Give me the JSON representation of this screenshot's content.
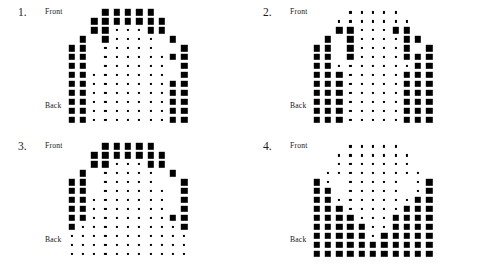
{
  "page": {
    "background": "#ffffff",
    "dot_color": "#000000",
    "width": 490,
    "height": 268
  },
  "labels": {
    "front": "Front",
    "back": "Back"
  },
  "panels": [
    {
      "id": "panel-1",
      "number": "1.",
      "front_label": "Front",
      "back_label": "Back",
      "chart_data": {
        "type": "heatmap",
        "title": "1.",
        "xlabel": "",
        "ylabel": "",
        "encoding": "dot area proportional to value; 0 = absent",
        "rows": 13,
        "cols": 11,
        "row_labels": [
          "Front",
          "",
          "",
          "",
          "",
          "",
          "",
          "",
          "",
          "",
          "",
          "",
          "Back"
        ],
        "vmin": 0,
        "vmax": 9,
        "values": [
          [
            0,
            0,
            0,
            9,
            9,
            9,
            9,
            9,
            0,
            0,
            0
          ],
          [
            0,
            0,
            9,
            9,
            9,
            9,
            9,
            9,
            9,
            0,
            0
          ],
          [
            0,
            0,
            9,
            9,
            1,
            1,
            1,
            9,
            9,
            0,
            0
          ],
          [
            0,
            9,
            0,
            9,
            1,
            1,
            1,
            1,
            0,
            9,
            0
          ],
          [
            9,
            9,
            0,
            1,
            1,
            1,
            1,
            1,
            0,
            0,
            9
          ],
          [
            9,
            9,
            0,
            1,
            1,
            1,
            1,
            1,
            1,
            9,
            9
          ],
          [
            9,
            9,
            0,
            1,
            1,
            1,
            1,
            1,
            1,
            0,
            9
          ],
          [
            9,
            9,
            1,
            1,
            1,
            1,
            1,
            1,
            1,
            0,
            9
          ],
          [
            9,
            9,
            1,
            1,
            1,
            1,
            1,
            1,
            1,
            9,
            9
          ],
          [
            9,
            9,
            1,
            1,
            1,
            1,
            1,
            1,
            1,
            9,
            9
          ],
          [
            9,
            9,
            1,
            1,
            1,
            1,
            1,
            1,
            1,
            9,
            9
          ],
          [
            9,
            9,
            1,
            1,
            1,
            1,
            1,
            1,
            1,
            9,
            9
          ],
          [
            9,
            9,
            1,
            1,
            1,
            1,
            1,
            1,
            1,
            9,
            9
          ]
        ]
      }
    },
    {
      "id": "panel-2",
      "number": "2.",
      "front_label": "Front",
      "back_label": "Back",
      "chart_data": {
        "type": "heatmap",
        "title": "2.",
        "xlabel": "",
        "ylabel": "",
        "encoding": "dot area proportional to value; 0 = absent",
        "rows": 13,
        "cols": 11,
        "row_labels": [
          "Front",
          "",
          "",
          "",
          "",
          "",
          "",
          "",
          "",
          "",
          "",
          "",
          "Back"
        ],
        "vmin": 0,
        "vmax": 9,
        "values": [
          [
            0,
            0,
            0,
            1,
            1,
            1,
            1,
            1,
            0,
            0,
            0
          ],
          [
            0,
            0,
            1,
            1,
            1,
            1,
            1,
            1,
            1,
            0,
            0
          ],
          [
            0,
            0,
            9,
            9,
            1,
            1,
            1,
            9,
            9,
            0,
            0
          ],
          [
            0,
            9,
            0,
            9,
            1,
            1,
            1,
            1,
            9,
            9,
            0
          ],
          [
            9,
            9,
            0,
            9,
            1,
            1,
            1,
            1,
            9,
            0,
            9
          ],
          [
            9,
            9,
            0,
            9,
            1,
            1,
            1,
            1,
            9,
            9,
            9
          ],
          [
            9,
            9,
            1,
            1,
            1,
            1,
            1,
            1,
            1,
            9,
            9
          ],
          [
            9,
            9,
            9,
            1,
            1,
            1,
            1,
            1,
            9,
            9,
            9
          ],
          [
            9,
            9,
            9,
            1,
            1,
            1,
            1,
            1,
            9,
            9,
            9
          ],
          [
            9,
            9,
            9,
            1,
            1,
            1,
            1,
            1,
            9,
            9,
            9
          ],
          [
            9,
            9,
            9,
            1,
            1,
            1,
            1,
            1,
            9,
            9,
            9
          ],
          [
            9,
            9,
            9,
            1,
            1,
            1,
            1,
            1,
            9,
            9,
            9
          ],
          [
            9,
            9,
            9,
            1,
            1,
            1,
            1,
            1,
            9,
            9,
            9
          ]
        ]
      }
    },
    {
      "id": "panel-3",
      "number": "3.",
      "front_label": "Front",
      "back_label": "Back",
      "chart_data": {
        "type": "heatmap",
        "title": "3.",
        "xlabel": "",
        "ylabel": "",
        "encoding": "dot area proportional to value; 0 = absent",
        "rows": 13,
        "cols": 11,
        "row_labels": [
          "Front",
          "",
          "",
          "",
          "",
          "",
          "",
          "",
          "",
          "",
          "",
          "",
          "Back"
        ],
        "vmin": 0,
        "vmax": 9,
        "values": [
          [
            0,
            0,
            0,
            9,
            9,
            9,
            9,
            9,
            0,
            0,
            0
          ],
          [
            0,
            0,
            9,
            9,
            9,
            9,
            9,
            9,
            9,
            0,
            0
          ],
          [
            0,
            0,
            9,
            9,
            1,
            1,
            1,
            9,
            9,
            0,
            0
          ],
          [
            0,
            9,
            0,
            1,
            1,
            1,
            1,
            1,
            0,
            9,
            0
          ],
          [
            9,
            9,
            0,
            1,
            1,
            1,
            1,
            1,
            0,
            0,
            9
          ],
          [
            9,
            9,
            0,
            1,
            1,
            1,
            1,
            1,
            1,
            0,
            9
          ],
          [
            9,
            9,
            1,
            1,
            1,
            1,
            1,
            1,
            1,
            0,
            9
          ],
          [
            9,
            9,
            1,
            1,
            1,
            1,
            1,
            1,
            1,
            0,
            9
          ],
          [
            9,
            9,
            1,
            1,
            1,
            1,
            1,
            1,
            1,
            9,
            9
          ],
          [
            9,
            1,
            1,
            1,
            1,
            1,
            1,
            1,
            1,
            1,
            9
          ],
          [
            1,
            1,
            1,
            1,
            1,
            1,
            1,
            1,
            1,
            1,
            1
          ],
          [
            1,
            1,
            1,
            1,
            1,
            1,
            1,
            1,
            1,
            1,
            1
          ],
          [
            1,
            1,
            1,
            1,
            1,
            1,
            1,
            1,
            1,
            1,
            1
          ]
        ]
      }
    },
    {
      "id": "panel-4",
      "number": "4.",
      "front_label": "Front",
      "back_label": "Back",
      "chart_data": {
        "type": "heatmap",
        "title": "4.",
        "xlabel": "",
        "ylabel": "",
        "encoding": "dot area proportional to value; 0 = absent",
        "rows": 13,
        "cols": 11,
        "row_labels": [
          "Front",
          "",
          "",
          "",
          "",
          "",
          "",
          "",
          "",
          "",
          "",
          "",
          "Back"
        ],
        "vmin": 0,
        "vmax": 9,
        "values": [
          [
            0,
            0,
            0,
            1,
            1,
            1,
            1,
            1,
            0,
            0,
            0
          ],
          [
            0,
            0,
            1,
            1,
            1,
            1,
            1,
            1,
            1,
            0,
            0
          ],
          [
            0,
            0,
            1,
            1,
            1,
            1,
            1,
            1,
            1,
            0,
            0
          ],
          [
            0,
            1,
            1,
            1,
            1,
            1,
            1,
            1,
            1,
            1,
            0
          ],
          [
            9,
            1,
            0,
            1,
            1,
            1,
            1,
            1,
            0,
            1,
            9
          ],
          [
            9,
            9,
            0,
            1,
            1,
            1,
            1,
            1,
            0,
            1,
            9
          ],
          [
            9,
            9,
            1,
            1,
            1,
            1,
            1,
            1,
            1,
            9,
            9
          ],
          [
            9,
            9,
            9,
            1,
            1,
            1,
            1,
            1,
            9,
            9,
            9
          ],
          [
            9,
            9,
            9,
            9,
            1,
            1,
            1,
            9,
            9,
            9,
            9
          ],
          [
            9,
            9,
            9,
            9,
            9,
            1,
            1,
            9,
            9,
            9,
            9
          ],
          [
            9,
            9,
            9,
            9,
            9,
            1,
            9,
            9,
            9,
            9,
            9
          ],
          [
            9,
            9,
            9,
            9,
            9,
            9,
            9,
            9,
            9,
            9,
            9
          ],
          [
            9,
            9,
            9,
            9,
            9,
            9,
            9,
            9,
            9,
            9,
            9
          ]
        ]
      }
    }
  ]
}
